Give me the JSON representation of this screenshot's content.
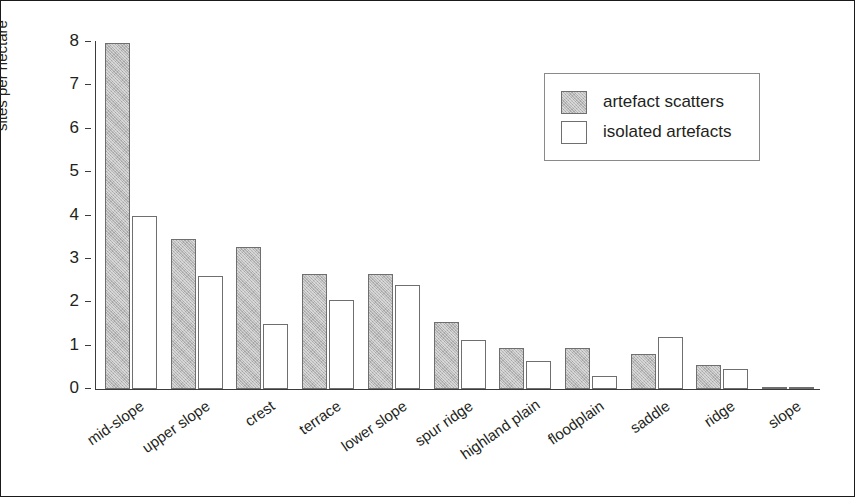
{
  "chart_data": {
    "type": "bar",
    "title": "",
    "xlabel": "",
    "ylabel": "sites per hectare",
    "ylim": [
      0,
      8
    ],
    "yticks": [
      0,
      1,
      2,
      3,
      4,
      5,
      6,
      7,
      8
    ],
    "ytick_labels": [
      "0",
      "1",
      "2",
      "3",
      "4",
      "5",
      "6",
      "7",
      "8"
    ],
    "grid": false,
    "legend_position": "upper right",
    "categories": [
      "mid-slope",
      "upper slope",
      "crest",
      "terrace",
      "lower slope",
      "spur ridge",
      "highland plain",
      "floodplain",
      "saddle",
      "ridge",
      "slope"
    ],
    "series": [
      {
        "name": "artefact scatters",
        "color": "#b8b8b8",
        "values": [
          7.98,
          3.45,
          3.28,
          2.65,
          2.65,
          1.55,
          0.95,
          0.95,
          0.8,
          0.55,
          0.05
        ]
      },
      {
        "name": "isolated artefacts",
        "color": "#ffffff",
        "values": [
          4.0,
          2.6,
          1.5,
          2.05,
          2.4,
          1.12,
          0.65,
          0.3,
          1.2,
          0.45,
          0.03
        ]
      }
    ]
  },
  "legend": {
    "items": [
      {
        "label": "artefact scatters",
        "swatch": "scatters"
      },
      {
        "label": "isolated artefacts",
        "swatch": "isolated"
      }
    ]
  }
}
